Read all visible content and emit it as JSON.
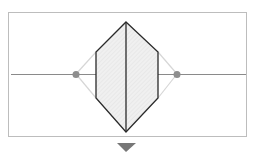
{
  "diagram": {
    "colors": {
      "frame": "#bdbdbd",
      "axis_line": "#8a8a8a",
      "hexagon_stroke": "#2a2a2a",
      "hexagon_fill": "#ececec",
      "guide_lines": "#d6d6d6",
      "dots": "#8e8e8e",
      "indicator": "#777777"
    },
    "frame": {
      "x": 8,
      "y": 12,
      "w": 238,
      "h": 124
    },
    "axis": {
      "x1": 11,
      "x2": 246,
      "y": 74
    },
    "hexagon_points": [
      [
        126,
        22
      ],
      [
        158,
        52
      ],
      [
        158,
        98
      ],
      [
        126,
        132
      ],
      [
        96,
        98
      ],
      [
        96,
        52
      ]
    ],
    "center_line": {
      "x": 126,
      "y1": 22,
      "y2": 132
    },
    "dots": [
      {
        "cx": 76,
        "cy": 74,
        "r": 3.5
      },
      {
        "cx": 177,
        "cy": 74,
        "r": 3.5
      }
    ],
    "guides": [
      [
        [
          76,
          74
        ],
        [
          96,
          52
        ]
      ],
      [
        [
          76,
          74
        ],
        [
          96,
          98
        ]
      ],
      [
        [
          177,
          74
        ],
        [
          158,
          52
        ]
      ],
      [
        [
          177,
          74
        ],
        [
          158,
          98
        ]
      ]
    ],
    "indicator_points": [
      [
        117,
        143
      ],
      [
        136,
        143
      ],
      [
        126,
        152
      ]
    ]
  }
}
